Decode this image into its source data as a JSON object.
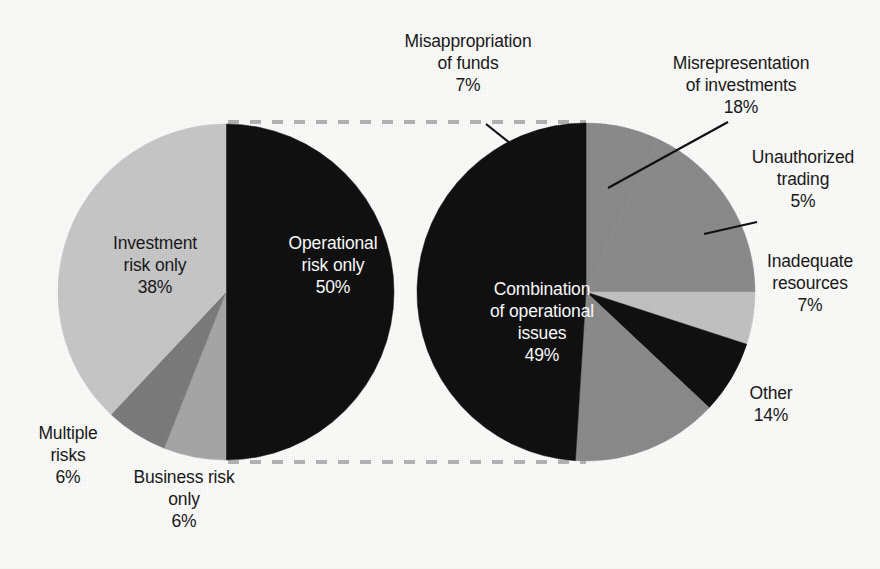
{
  "chart_data": [
    {
      "type": "pie",
      "name": "left-pie",
      "title": "",
      "center": [
        226,
        292
      ],
      "radius": 168,
      "start_angle_deg": -90,
      "direction": "clockwise",
      "legend": "none",
      "categories": [
        "Operational risk only",
        "Business risk only",
        "Multiple risks",
        "Investment risk only"
      ],
      "values": [
        50,
        6,
        6,
        38
      ],
      "value_labels": [
        "50%",
        "6%",
        "6%",
        "38%"
      ],
      "colors": [
        "#111111",
        "#a8a8a8",
        "#7d7d7d",
        "#c9c9c9"
      ],
      "slices": [
        {
          "label_lines": [
            "Operational",
            "risk only"
          ],
          "value_label": "50%",
          "value": 50,
          "color": "#111111",
          "label_placement": "inside",
          "label_color": "#ffffff"
        },
        {
          "label_lines": [
            "Business risk",
            "only"
          ],
          "value_label": "6%",
          "value": 6,
          "color": "#a8a8a8",
          "label_placement": "outside",
          "label_color": "#1a1a1a"
        },
        {
          "label_lines": [
            "Multiple",
            "risks"
          ],
          "value_label": "6%",
          "value": 6,
          "color": "#7d7d7d",
          "label_placement": "outside",
          "label_color": "#1a1a1a"
        },
        {
          "label_lines": [
            "Investment",
            "risk only"
          ],
          "value_label": "38%",
          "value": 38,
          "color": "#c9c9c9",
          "label_placement": "inside",
          "label_color": "#1a1a1a"
        }
      ]
    },
    {
      "type": "pie",
      "name": "right-pie",
      "title": "",
      "center": [
        586,
        292
      ],
      "radius": 169,
      "start_angle_deg": -90,
      "direction": "clockwise",
      "legend": "none",
      "categories": [
        "Misappropriation of funds",
        "Misrepresentation of investments",
        "Unauthorized trading",
        "Inadequate resources",
        "Other",
        "Combination of operational issues"
      ],
      "values": [
        7,
        18,
        5,
        7,
        14,
        49
      ],
      "value_labels": [
        "7%",
        "18%",
        "5%",
        "7%",
        "14%",
        "49%"
      ],
      "colors": [
        "#8c8c8c",
        "#8c8c8c",
        "#c4c4c4",
        "#111111",
        "#8c8c8c",
        "#111111"
      ],
      "slices": [
        {
          "label_lines": [
            "Misappropriation",
            "of funds"
          ],
          "value_label": "7%",
          "value": 7,
          "color": "#8c8c8c",
          "label_placement": "leader",
          "label_color": "#1a1a1a"
        },
        {
          "label_lines": [
            "Misrepresentation",
            "of investments"
          ],
          "value_label": "18%",
          "value": 18,
          "color": "#8c8c8c",
          "label_placement": "leader",
          "label_color": "#1a1a1a"
        },
        {
          "label_lines": [
            "Unauthorized",
            "trading"
          ],
          "value_label": "5%",
          "value": 5,
          "color": "#c4c4c4",
          "label_placement": "leader",
          "label_color": "#1a1a1a"
        },
        {
          "label_lines": [
            "Inadequate",
            "resources"
          ],
          "value_label": "7%",
          "value": 7,
          "color": "#111111",
          "label_placement": "outside",
          "label_color": "#1a1a1a"
        },
        {
          "label_lines": [
            "Other"
          ],
          "value_label": "14%",
          "value": 14,
          "color": "#8c8c8c",
          "label_placement": "outside",
          "label_color": "#1a1a1a"
        },
        {
          "label_lines": [
            "Combination",
            "of operational",
            "issues"
          ],
          "value_label": "49%",
          "value": 49,
          "color": "#111111",
          "label_placement": "inside",
          "label_color": "#ffffff"
        }
      ]
    }
  ],
  "labels": {
    "left": {
      "operational": {
        "l1": "Operational",
        "l2": "risk only",
        "pct": "50%"
      },
      "investment": {
        "l1": "Investment",
        "l2": "risk only",
        "pct": "38%"
      },
      "multiple": {
        "l1": "Multiple",
        "l2": "risks",
        "pct": "6%"
      },
      "business": {
        "l1": "Business risk",
        "l2": "only",
        "pct": "6%"
      }
    },
    "right": {
      "misappropriation": {
        "l1": "Misappropriation",
        "l2": "of funds",
        "pct": "7%"
      },
      "misrepresentation": {
        "l1": "Misrepresentation",
        "l2": "of investments",
        "pct": "18%"
      },
      "unauthorized": {
        "l1": "Unauthorized",
        "l2": "trading",
        "pct": "5%"
      },
      "inadequate": {
        "l1": "Inadequate",
        "l2": "resources",
        "pct": "7%"
      },
      "other": {
        "l1": "Other",
        "l2": "",
        "pct": "14%"
      },
      "combination": {
        "l1": "Combination",
        "l2": "of operational",
        "l3": "issues",
        "pct": "49%"
      }
    }
  },
  "connectors": {
    "style": "dashed",
    "color": "#b5b5b5",
    "top_y": 122,
    "bottom_y": 462,
    "x_start": 228,
    "x_end": 586
  },
  "colors": {
    "black": "#111111",
    "dark_gray": "#7d7d7d",
    "mid_gray": "#8c8c8c",
    "gray": "#a8a8a8",
    "light_gray": "#c9c9c9",
    "pale_gray": "#c4c4c4",
    "background": "#fdfdfc",
    "text": "#1a1a1a",
    "text_on_dark": "#ffffff"
  }
}
